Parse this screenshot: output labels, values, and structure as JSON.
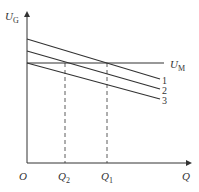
{
  "diagram": {
    "axes": {
      "y_label_main": "U",
      "y_label_sub": "G",
      "x_label": "Q",
      "origin_label": "O"
    },
    "horizontal_line": {
      "label_main": "U",
      "label_sub": "M"
    },
    "lines": [
      {
        "id": "1",
        "label": "1"
      },
      {
        "id": "2",
        "label": "2"
      },
      {
        "id": "3",
        "label": "3"
      }
    ],
    "x_markers": [
      {
        "label_main": "Q",
        "label_sub": "2"
      },
      {
        "label_main": "Q",
        "label_sub": "1"
      }
    ],
    "colors": {
      "line": "#333333",
      "background": "#ffffff"
    }
  }
}
